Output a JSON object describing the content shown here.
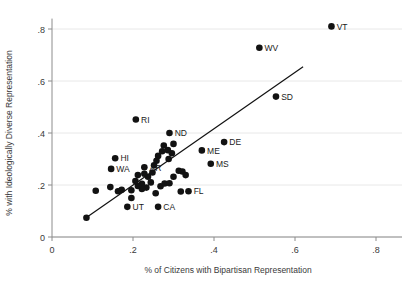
{
  "chart_data": {
    "type": "scatter",
    "title": "",
    "subtitle": "",
    "xlabel": "% of Citizens with Bipartisan Representation",
    "ylabel": "% with Ideologically Diverse Representation",
    "xlim": [
      0,
      0.85
    ],
    "ylim": [
      0,
      0.85
    ],
    "xticks": [
      0,
      0.2,
      0.4,
      0.6,
      0.8
    ],
    "xticklabels": [
      "0",
      ".2",
      ".4",
      ".6",
      ".8"
    ],
    "yticks": [
      0,
      0.2,
      0.4,
      0.6,
      0.8
    ],
    "yticklabels": [
      "0",
      ".2",
      ".4",
      ".6",
      ".8"
    ],
    "grid": "horizontal",
    "legend": "none",
    "marker": "filled-circle",
    "marker_color": "#121212",
    "fit_line": {
      "type": "linear",
      "color": "#111111",
      "x_start": 0.085,
      "y_start": 0.075,
      "x_end": 0.62,
      "y_end": 0.655
    },
    "points": [
      {
        "label": "VT",
        "x": 0.69,
        "y": 0.81,
        "label_pos": "right"
      },
      {
        "label": "WV",
        "x": 0.512,
        "y": 0.728,
        "label_pos": "right"
      },
      {
        "label": "SD",
        "x": 0.553,
        "y": 0.54,
        "label_pos": "right"
      },
      {
        "label": "RI",
        "x": 0.207,
        "y": 0.452,
        "label_pos": "right"
      },
      {
        "label": "ND",
        "x": 0.29,
        "y": 0.4,
        "label_pos": "right"
      },
      {
        "label": "DE",
        "x": 0.425,
        "y": 0.365,
        "label_pos": "right"
      },
      {
        "label": "ME",
        "x": 0.37,
        "y": 0.333,
        "label_pos": "right"
      },
      {
        "label": "MS",
        "x": 0.392,
        "y": 0.282,
        "label_pos": "right"
      },
      {
        "label": "HI",
        "x": 0.156,
        "y": 0.303,
        "label_pos": "right"
      },
      {
        "label": "WA",
        "x": 0.146,
        "y": 0.262,
        "label_pos": "right"
      },
      {
        "label": "AR",
        "x": 0.228,
        "y": 0.268,
        "label_pos": "right"
      },
      {
        "label": "FL",
        "x": 0.337,
        "y": 0.176,
        "label_pos": "right"
      },
      {
        "label": "UT",
        "x": 0.186,
        "y": 0.116,
        "label_pos": "right"
      },
      {
        "label": "CA",
        "x": 0.262,
        "y": 0.116,
        "label_pos": "right"
      },
      {
        "label": "",
        "x": 0.085,
        "y": 0.074
      },
      {
        "label": "",
        "x": 0.108,
        "y": 0.178
      },
      {
        "label": "",
        "x": 0.163,
        "y": 0.176
      },
      {
        "label": "",
        "x": 0.196,
        "y": 0.18
      },
      {
        "label": "",
        "x": 0.222,
        "y": 0.205
      },
      {
        "label": "",
        "x": 0.237,
        "y": 0.232
      },
      {
        "label": "",
        "x": 0.248,
        "y": 0.248
      },
      {
        "label": "",
        "x": 0.252,
        "y": 0.276
      },
      {
        "label": "",
        "x": 0.258,
        "y": 0.293
      },
      {
        "label": "",
        "x": 0.262,
        "y": 0.312
      },
      {
        "label": "",
        "x": 0.272,
        "y": 0.33
      },
      {
        "label": "",
        "x": 0.286,
        "y": 0.334
      },
      {
        "label": "",
        "x": 0.288,
        "y": 0.3
      },
      {
        "label": "",
        "x": 0.296,
        "y": 0.322
      },
      {
        "label": "",
        "x": 0.244,
        "y": 0.21
      },
      {
        "label": "",
        "x": 0.233,
        "y": 0.19
      },
      {
        "label": "",
        "x": 0.222,
        "y": 0.185
      },
      {
        "label": "",
        "x": 0.212,
        "y": 0.196
      },
      {
        "label": "",
        "x": 0.206,
        "y": 0.215
      },
      {
        "label": "",
        "x": 0.212,
        "y": 0.238
      },
      {
        "label": "",
        "x": 0.228,
        "y": 0.243
      },
      {
        "label": "",
        "x": 0.268,
        "y": 0.195
      },
      {
        "label": "",
        "x": 0.278,
        "y": 0.206
      },
      {
        "label": "",
        "x": 0.29,
        "y": 0.207
      },
      {
        "label": "",
        "x": 0.3,
        "y": 0.232
      },
      {
        "label": "",
        "x": 0.313,
        "y": 0.255
      },
      {
        "label": "",
        "x": 0.322,
        "y": 0.252
      },
      {
        "label": "",
        "x": 0.33,
        "y": 0.238
      },
      {
        "label": "",
        "x": 0.318,
        "y": 0.175
      },
      {
        "label": "",
        "x": 0.256,
        "y": 0.168
      },
      {
        "label": "",
        "x": 0.196,
        "y": 0.15
      },
      {
        "label": "",
        "x": 0.172,
        "y": 0.182
      },
      {
        "label": "",
        "x": 0.144,
        "y": 0.192
      },
      {
        "label": "",
        "x": 0.3,
        "y": 0.358
      },
      {
        "label": "",
        "x": 0.276,
        "y": 0.352
      }
    ]
  }
}
